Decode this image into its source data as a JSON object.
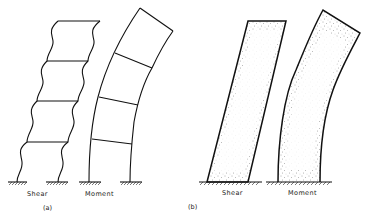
{
  "figure": {
    "panel_a": {
      "label": "(a)",
      "frames": [
        {
          "id": "shear",
          "caption": "Shear",
          "stories": 4,
          "deformation": "shear-racking (wavy columns)"
        },
        {
          "id": "moment",
          "caption": "Moment",
          "stories": 4,
          "deformation": "flexural bending (curved)"
        }
      ]
    },
    "panel_b": {
      "label": "(b)",
      "walls": [
        {
          "id": "shear",
          "caption": "Shear",
          "deformation": "straight tilt",
          "fill": "stippled"
        },
        {
          "id": "moment",
          "caption": "Moment",
          "deformation": "curved bending",
          "fill": "stippled"
        }
      ]
    }
  },
  "colors": {
    "line": "#111111",
    "background": "#ffffff",
    "stipple": "#555555"
  }
}
